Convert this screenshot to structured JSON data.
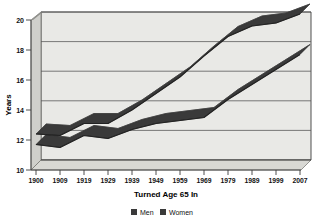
{
  "chart": {
    "title_fragment": "",
    "ylabel": "Years",
    "xlabel": "Turned Age 65 In",
    "legend": [
      {
        "label": "Men",
        "color": "#3a3a3a"
      },
      {
        "label": "Women",
        "color": "#3a3a3a"
      }
    ],
    "y_ticks": [
      "10",
      "12",
      "14",
      "16",
      "18",
      "20"
    ],
    "x_ticks": [
      "1900",
      "1909",
      "1919",
      "1929",
      "1939",
      "1949",
      "1959",
      "1969",
      "1979",
      "1989",
      "1999",
      "2007"
    ],
    "colors": {
      "plot_background": "#e6e6e3",
      "wall_back": "#e9e9e6",
      "wall_side": "#cfcfcb",
      "floor": "#d8d8d4",
      "gridline": "#5a5a5a",
      "frame": "#3c3c3c",
      "series_men": "#3a3a3a",
      "series_women": "#3a3a3a",
      "text": "#111111"
    }
  },
  "chart_data": {
    "type": "line",
    "title": "",
    "xlabel": "Turned Age 65 In",
    "ylabel": "Years",
    "ylim": [
      10,
      20.8
    ],
    "y_tick_values": [
      10,
      12,
      14,
      16,
      18,
      20
    ],
    "grid": "horizontal",
    "legend_position": "bottom",
    "categories": [
      "1900",
      "1909",
      "1919",
      "1929",
      "1939",
      "1949",
      "1959",
      "1969",
      "1979",
      "1989",
      "1999",
      "2007"
    ],
    "x": [
      1900,
      1909,
      1919,
      1929,
      1939,
      1949,
      1959,
      1969,
      1979,
      1989,
      1999,
      2007
    ],
    "series": [
      {
        "name": "Men",
        "values": [
          11.7,
          11.5,
          12.3,
          12.1,
          12.7,
          13.1,
          13.3,
          13.5,
          14.7,
          15.7,
          16.7,
          17.7
        ]
      },
      {
        "name": "Women",
        "values": [
          12.4,
          12.3,
          13.1,
          13.1,
          14.0,
          15.1,
          16.2,
          17.6,
          18.9,
          19.6,
          19.8,
          20.4
        ]
      }
    ]
  }
}
